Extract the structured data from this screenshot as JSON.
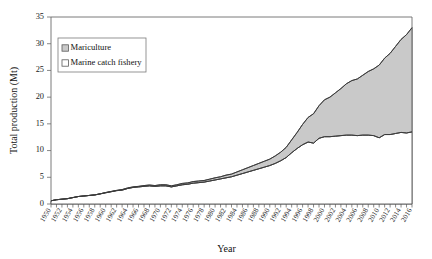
{
  "chart_data": {
    "type": "area",
    "title": "",
    "xlabel": "Year",
    "ylabel": "Total production (Mt)",
    "xlim": [
      1950,
      2016
    ],
    "ylim": [
      0,
      35
    ],
    "ytick_step": 5,
    "xtick_step": 2,
    "grid": false,
    "stacked": true,
    "legend_position": "upper-left-inside",
    "ytick_labels": [
      "0",
      "5",
      "10",
      "15",
      "20",
      "25",
      "30",
      "35"
    ],
    "ytick_values": [
      0,
      5,
      10,
      15,
      20,
      25,
      30,
      35
    ],
    "xtick_labels": [
      "1950",
      "1952",
      "1954",
      "1956",
      "1958",
      "1960",
      "1962",
      "1964",
      "1966",
      "1968",
      "1970",
      "1972",
      "1974",
      "1976",
      "1978",
      "1980",
      "1982",
      "1984",
      "1986",
      "1988",
      "1990",
      "1992",
      "1994",
      "1996",
      "1998",
      "2000",
      "2002",
      "2004",
      "2006",
      "2008",
      "2010",
      "2012",
      "2014",
      "2016"
    ],
    "x": [
      1950,
      1951,
      1952,
      1953,
      1954,
      1955,
      1956,
      1957,
      1958,
      1959,
      1960,
      1961,
      1962,
      1963,
      1964,
      1965,
      1966,
      1967,
      1968,
      1969,
      1970,
      1971,
      1972,
      1973,
      1974,
      1975,
      1976,
      1977,
      1978,
      1979,
      1980,
      1981,
      1982,
      1983,
      1984,
      1985,
      1986,
      1987,
      1988,
      1989,
      1990,
      1991,
      1992,
      1993,
      1994,
      1995,
      1996,
      1997,
      1998,
      1999,
      2000,
      2001,
      2002,
      2003,
      2004,
      2005,
      2006,
      2007,
      2008,
      2009,
      2010,
      2011,
      2012,
      2013,
      2014,
      2015,
      2016
    ],
    "series": [
      {
        "name": "Marine catch fishery",
        "color": "#ffffff",
        "marker": "open-square",
        "values": [
          0.6,
          0.8,
          0.9,
          1.0,
          1.2,
          1.4,
          1.5,
          1.6,
          1.7,
          1.9,
          2.1,
          2.3,
          2.5,
          2.6,
          2.9,
          3.1,
          3.2,
          3.3,
          3.4,
          3.3,
          3.4,
          3.4,
          3.2,
          3.4,
          3.6,
          3.7,
          3.9,
          4.0,
          4.1,
          4.3,
          4.5,
          4.7,
          4.9,
          5.1,
          5.4,
          5.7,
          6.0,
          6.3,
          6.6,
          6.9,
          7.2,
          7.6,
          8.1,
          8.7,
          9.6,
          10.4,
          11.1,
          11.6,
          11.4,
          12.3,
          12.6,
          12.6,
          12.7,
          12.8,
          12.9,
          12.9,
          12.8,
          12.9,
          12.9,
          12.8,
          12.4,
          13.0,
          13.0,
          13.2,
          13.4,
          13.3,
          13.5
        ]
      },
      {
        "name": "Mariculture",
        "color": "#c9c9c9",
        "marker": "filled-square",
        "values": [
          0.0,
          0.0,
          0.0,
          0.0,
          0.0,
          0.0,
          0.0,
          0.0,
          0.0,
          0.0,
          0.05,
          0.05,
          0.05,
          0.1,
          0.1,
          0.1,
          0.1,
          0.15,
          0.15,
          0.15,
          0.2,
          0.2,
          0.2,
          0.2,
          0.25,
          0.25,
          0.3,
          0.3,
          0.3,
          0.35,
          0.4,
          0.4,
          0.5,
          0.5,
          0.6,
          0.7,
          0.8,
          0.9,
          1.0,
          1.1,
          1.2,
          1.4,
          1.6,
          1.9,
          2.4,
          3.0,
          3.8,
          4.6,
          5.5,
          6.1,
          6.9,
          7.4,
          8.1,
          8.8,
          9.6,
          10.2,
          10.6,
          11.2,
          11.9,
          12.5,
          13.6,
          14.3,
          15.2,
          16.3,
          17.4,
          18.4,
          19.5
        ]
      }
    ],
    "totals": [
      0.6,
      0.8,
      0.9,
      1.0,
      1.2,
      1.4,
      1.5,
      1.6,
      1.7,
      1.9,
      2.15,
      2.35,
      2.55,
      2.7,
      3.0,
      3.2,
      3.3,
      3.45,
      3.55,
      3.45,
      3.6,
      3.6,
      3.4,
      3.6,
      3.85,
      3.95,
      4.2,
      4.3,
      4.4,
      4.65,
      4.9,
      5.1,
      5.4,
      5.6,
      6.0,
      6.4,
      6.8,
      7.2,
      7.6,
      8.0,
      8.4,
      9.0,
      9.7,
      10.6,
      12.0,
      13.4,
      14.9,
      16.2,
      16.9,
      18.4,
      19.5,
      20.0,
      20.8,
      21.6,
      22.5,
      23.1,
      23.4,
      24.1,
      24.8,
      25.3,
      26.0,
      27.3,
      28.2,
      29.5,
      30.8,
      31.7,
      33.0
    ]
  },
  "legend": {
    "items": [
      {
        "label": "Mariculture",
        "swatch": "filled-square",
        "color": "#c9c9c9"
      },
      {
        "label": "Marine catch fishery",
        "swatch": "open-square",
        "color": "#ffffff"
      }
    ]
  },
  "axes": {
    "x_title": "Year",
    "y_title": "Total production (Mt)"
  }
}
